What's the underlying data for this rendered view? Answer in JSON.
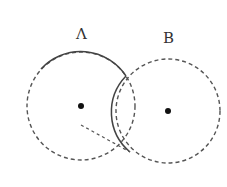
{
  "diagram": {
    "labels": {
      "a": "Λ",
      "b": "B"
    },
    "colors": {
      "stroke": "#444444",
      "dot": "#111111",
      "background": "#ffffff"
    },
    "circles": [
      {
        "id": "A",
        "cx": 81,
        "cy": 106,
        "r": 54
      },
      {
        "id": "B",
        "cx": 168,
        "cy": 111,
        "r": 52
      }
    ]
  }
}
